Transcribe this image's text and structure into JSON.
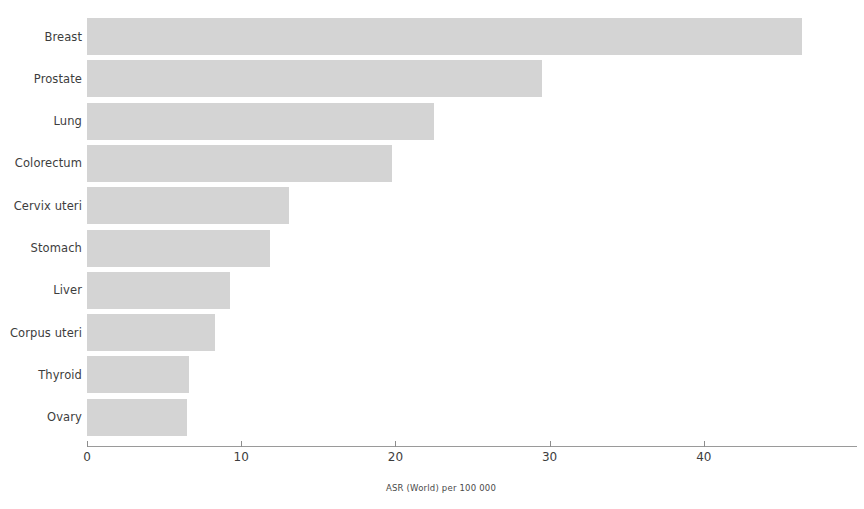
{
  "chart_data": {
    "type": "bar",
    "orientation": "horizontal",
    "title": "",
    "subtitle": "",
    "xlabel": "ASR (World) per 100 000",
    "ylabel": "",
    "xlim": [
      0,
      47
    ],
    "xticks": [
      0,
      10,
      20,
      30,
      40
    ],
    "xtick_labels": [
      "0",
      "10",
      "20",
      "30",
      "40"
    ],
    "grid": false,
    "legend": false,
    "bar_color": "#d4d4d4",
    "axis_color": "#9a9a9a",
    "text_color": "#3d3d3d",
    "categories": [
      "Breast",
      "Prostate",
      "Lung",
      "Colorectum",
      "Cervix uteri",
      "Stomach",
      "Liver",
      "Corpus uteri",
      "Thyroid",
      "Ovary"
    ],
    "values": [
      46.4,
      29.5,
      22.5,
      19.8,
      13.1,
      11.9,
      9.3,
      8.3,
      6.6,
      6.5
    ]
  }
}
